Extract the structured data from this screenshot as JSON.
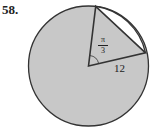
{
  "problem_number": "58.",
  "angle": {
    "numerator": "π",
    "denominator": "3"
  },
  "radius_label": "12",
  "colors": {
    "shade": "#c8c8c8",
    "stroke": "#333333",
    "background": "#ffffff"
  }
}
